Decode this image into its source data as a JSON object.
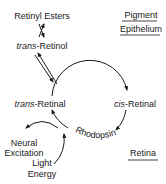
{
  "diagram": {
    "type": "visual cycle diagram",
    "colors": {
      "ink": "#1a1a1a",
      "background": "#ffffff"
    },
    "regions": {
      "pigment_epithelium": {
        "line1": "Pigment",
        "line2": "Epithelium"
      },
      "retina": {
        "label": "Retina"
      }
    },
    "nodes": {
      "retinyl_esters": {
        "label": "Retinyl Esters"
      },
      "trans_retinol": {
        "prefix": "trans",
        "suffix": "-Retinol"
      },
      "trans_retinal": {
        "prefix": "trans",
        "suffix": "-Retinal"
      },
      "cis_retinal": {
        "prefix": "cis",
        "suffix": "-Retinal"
      },
      "rhodopsin": {
        "label": "Rhodopsin"
      },
      "neural_excitation": {
        "line1": "Neural",
        "line2": "Excitation"
      },
      "light_energy": {
        "line1": "Light",
        "line2": "Energy"
      }
    },
    "edges": [
      {
        "from": "Retinyl Esters",
        "to": "trans-Retinol",
        "type": "reversible"
      },
      {
        "from": "trans-Retinol",
        "to": "trans-Retinal",
        "type": "reversible"
      },
      {
        "from": "trans-Retinal",
        "to": "cis-Retinal",
        "type": "cycle-arc"
      },
      {
        "from": "cis-Retinal",
        "to": "Rhodopsin",
        "type": "cycle-arc"
      },
      {
        "from": "Rhodopsin",
        "to": "trans-Retinal",
        "type": "cycle-arc"
      },
      {
        "from": "Rhodopsin",
        "to": "Neural Excitation",
        "type": "output"
      },
      {
        "from": "Light Energy",
        "to": "Rhodopsin",
        "type": "input"
      }
    ]
  }
}
